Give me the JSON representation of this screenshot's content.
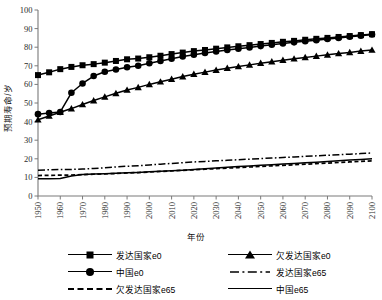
{
  "chart_data": {
    "type": "line",
    "title": "",
    "xlabel": "年份",
    "ylabel": "预期寿命/岁",
    "xlim": [
      1950,
      2100
    ],
    "ylim": [
      0,
      100
    ],
    "grid": false,
    "legend_position": "bottom",
    "xticks": [
      "1950",
      "1960",
      "1970",
      "1980",
      "1990",
      "2000",
      "2010",
      "2020",
      "2030",
      "2040",
      "2050",
      "2060",
      "2070",
      "2080",
      "2090",
      "2100"
    ],
    "yticks": [
      "0",
      "10",
      "20",
      "30",
      "40",
      "50",
      "60",
      "70",
      "80",
      "90",
      "100"
    ],
    "x": [
      1950,
      1955,
      1960,
      1965,
      1970,
      1975,
      1980,
      1985,
      1990,
      1995,
      2000,
      2005,
      2010,
      2015,
      2020,
      2025,
      2030,
      2035,
      2040,
      2045,
      2050,
      2055,
      2060,
      2065,
      2070,
      2075,
      2080,
      2085,
      2090,
      2095,
      2100
    ],
    "series": [
      {
        "name": "发达国家e0",
        "marker": "square",
        "style": "solid-marker",
        "values": [
          65.0,
          66.5,
          68.2,
          69.4,
          70.3,
          70.9,
          71.7,
          72.6,
          73.5,
          73.9,
          74.6,
          75.4,
          76.3,
          77.1,
          77.9,
          78.5,
          79.2,
          79.9,
          80.5,
          81.1,
          81.7,
          82.3,
          82.9,
          83.4,
          84.0,
          84.5,
          85.0,
          85.5,
          86.0,
          86.5,
          87.0
        ]
      },
      {
        "name": "中国e0",
        "marker": "circle",
        "style": "solid-marker",
        "values": [
          44.0,
          44.6,
          45.2,
          55.5,
          60.5,
          64.5,
          66.8,
          68.0,
          69.2,
          70.0,
          71.4,
          72.6,
          73.8,
          75.0,
          76.0,
          76.9,
          77.7,
          78.5,
          79.2,
          79.9,
          80.6,
          81.3,
          82.0,
          82.6,
          83.2,
          83.8,
          84.4,
          85.0,
          85.6,
          86.2,
          86.8
        ]
      },
      {
        "name": "欠发达国家e0",
        "marker": "triangle",
        "style": "solid-marker",
        "values": [
          41.0,
          43.0,
          45.0,
          47.0,
          49.2,
          51.3,
          53.3,
          55.2,
          57.0,
          58.4,
          60.0,
          61.4,
          62.8,
          64.2,
          65.5,
          66.6,
          67.7,
          68.7,
          69.6,
          70.5,
          71.4,
          72.2,
          73.0,
          73.8,
          74.5,
          75.2,
          75.9,
          76.6,
          77.2,
          77.9,
          78.5
        ]
      },
      {
        "name": "发达国家e65",
        "marker": "none",
        "style": "dash-dot",
        "values": [
          13.9,
          14.1,
          14.2,
          14.3,
          14.5,
          14.8,
          15.2,
          15.6,
          16.0,
          16.3,
          16.7,
          17.1,
          17.5,
          17.9,
          18.3,
          18.6,
          18.9,
          19.2,
          19.5,
          19.8,
          20.1,
          20.4,
          20.7,
          21.0,
          21.3,
          21.6,
          21.9,
          22.2,
          22.5,
          22.8,
          23.1
        ]
      },
      {
        "name": "欠发达国家e65",
        "marker": "none",
        "style": "dashed",
        "values": [
          11.0,
          11.1,
          11.2,
          11.3,
          11.5,
          11.7,
          11.9,
          12.1,
          12.4,
          12.6,
          12.9,
          13.2,
          13.5,
          13.8,
          14.1,
          14.4,
          14.7,
          15.0,
          15.3,
          15.6,
          15.9,
          16.2,
          16.5,
          16.8,
          17.1,
          17.4,
          17.7,
          18.0,
          18.3,
          18.6,
          18.9
        ]
      },
      {
        "name": "中国e65",
        "marker": "none",
        "style": "solid",
        "values": [
          9.3,
          9.3,
          9.4,
          10.8,
          11.5,
          11.8,
          12.0,
          12.2,
          12.5,
          12.7,
          13.0,
          13.3,
          13.6,
          13.9,
          14.3,
          14.7,
          15.1,
          15.4,
          15.8,
          16.1,
          16.5,
          16.8,
          17.2,
          17.5,
          17.9,
          18.2,
          18.6,
          18.9,
          19.3,
          19.6,
          20.0
        ]
      }
    ]
  },
  "legend": {
    "columns": [
      {
        "items": [
          {
            "label": "发达国家e0",
            "key": "square-solid"
          },
          {
            "label": "中国e0",
            "key": "circle-solid"
          },
          {
            "label": "欠发达国家e65",
            "key": "dashed"
          }
        ]
      },
      {
        "items": [
          {
            "label": "欠发达国家e0",
            "key": "triangle-solid"
          },
          {
            "label": "发达国家e65",
            "key": "dash-dot"
          },
          {
            "label": "中国e65",
            "key": "solid"
          }
        ]
      }
    ]
  }
}
